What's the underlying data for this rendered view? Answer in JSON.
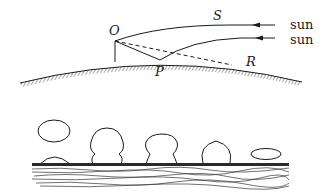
{
  "figure": {
    "top_panel": {
      "labels": {
        "O": "O",
        "S": "S",
        "P": "P",
        "R": "R",
        "sun1": "sun",
        "sun2": "sun"
      }
    },
    "bottom_panel": {
      "droplet_count": 5
    },
    "colors": {
      "ink": "#1a1a1a",
      "background": "#ffffff"
    }
  }
}
